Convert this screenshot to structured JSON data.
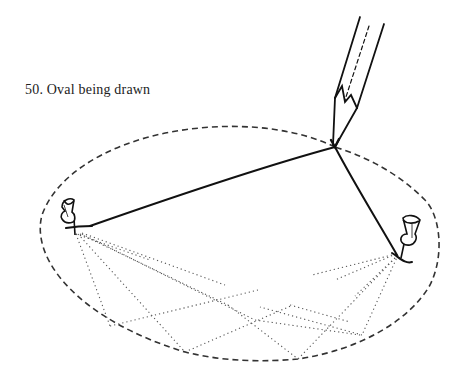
{
  "figure": {
    "caption": "50.  Oval being drawn",
    "number": "50",
    "title": "Oval being drawn"
  },
  "elements": {
    "pencil": "pencil-icon",
    "left_pin": "pushpin-icon",
    "right_pin": "pushpin-icon",
    "string": "string-loop",
    "oval": "dashed-oval-outline",
    "construction_lines": "dotted-string-positions"
  },
  "colors": {
    "ink": "#111111",
    "dashed": "#333333",
    "dotted": "#555555",
    "background": "#ffffff"
  }
}
